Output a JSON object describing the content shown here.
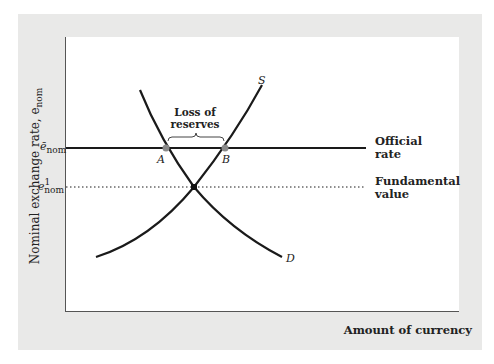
{
  "axes": {
    "y_label": "Nominal exchange rate, e",
    "y_label_sub": "nom",
    "x_label": "Amount of currency"
  },
  "ticks": {
    "official": {
      "symbol": "ē",
      "sub": "nom"
    },
    "fundamental": {
      "symbol": "e",
      "sup": "1",
      "sub": "nom"
    }
  },
  "legend": {
    "official_line1": "Official",
    "official_line2": "rate",
    "fundamental_line1": "Fundamental",
    "fundamental_line2": "value"
  },
  "annotation": {
    "line1": "Loss of",
    "line2": "reserves"
  },
  "curves": {
    "supply_label": "S",
    "demand_label": "D"
  },
  "points": {
    "a_label": "A",
    "b_label": "B"
  },
  "colors": {
    "panel": "#e9e9e8",
    "plot": "#ffffff",
    "curve": "#1a1a1a",
    "marker": "#8a8a8a"
  }
}
